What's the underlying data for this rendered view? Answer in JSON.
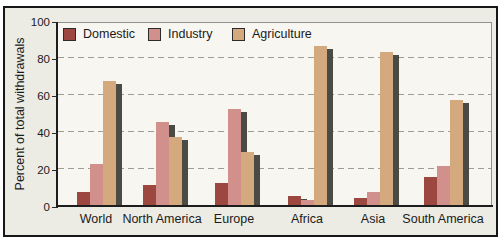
{
  "chart_data": {
    "type": "bar",
    "title": "",
    "xlabel": "",
    "ylabel": "Percent of total withdrawals",
    "ylim": [
      0,
      100
    ],
    "yticks": [
      0,
      20,
      40,
      60,
      80,
      100
    ],
    "grid_values": [
      20,
      40,
      60,
      80
    ],
    "grid": "horizontal-dashed",
    "legend_position": "top-left-inside-plot",
    "categories": [
      "World",
      "North America",
      "Europe",
      "Africa",
      "Asia",
      "South America"
    ],
    "series": [
      {
        "name": "Domestic",
        "color": "#9c4740",
        "values": [
          8,
          12,
          13,
          6,
          5,
          16
        ]
      },
      {
        "name": "Industry",
        "color": "#d2908d",
        "values": [
          23,
          46,
          53,
          4,
          8,
          22
        ]
      },
      {
        "name": "Agriculture",
        "color": "#d5a97e",
        "values": [
          68,
          38,
          30,
          87,
          84,
          58
        ]
      }
    ],
    "bar_shadow_color": "#4b4b46"
  },
  "colors": {
    "figure_background": "#ecebe4",
    "plot_background": "#f7f6f1",
    "frame_border": "#171717",
    "gridline": "#9d9d96",
    "text": "#1b1b1b"
  }
}
